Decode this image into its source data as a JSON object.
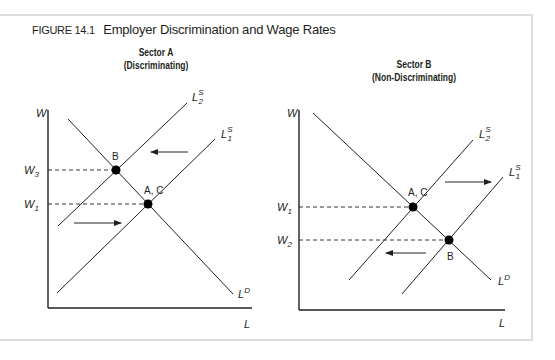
{
  "figure": {
    "number": "FIGURE 14.1",
    "title": "Employer Discrimination and Wage Rates"
  },
  "panels": [
    {
      "title": "Sector A",
      "subtitle": "(Discriminating)",
      "y_axis_label": "W",
      "x_axis_label": "L",
      "wage_labels": [
        {
          "main": "W",
          "sub": "3"
        },
        {
          "main": "W",
          "sub": "1"
        }
      ],
      "curves": {
        "supply_2": {
          "main": "L",
          "sup": "S",
          "sub": "2"
        },
        "supply_1": {
          "main": "L",
          "sup": "S",
          "sub": "1"
        },
        "demand": {
          "main": "L",
          "sup": "D"
        }
      },
      "points": [
        {
          "label": "B",
          "wage": "W3"
        },
        {
          "label": "A, C",
          "wage": "W1"
        }
      ],
      "arrows": [
        "left (upper: supply shifts left)",
        "right (lower: supply shifts right)"
      ]
    },
    {
      "title": "Sector B",
      "subtitle": "(Non-Discriminating)",
      "y_axis_label": "W",
      "x_axis_label": "L",
      "wage_labels": [
        {
          "main": "W",
          "sub": "1"
        },
        {
          "main": "W",
          "sub": "2"
        }
      ],
      "curves": {
        "supply_2": {
          "main": "L",
          "sup": "S",
          "sub": "2"
        },
        "supply_1": {
          "main": "L",
          "sup": "S",
          "sub": "1"
        },
        "demand": {
          "main": "L",
          "sup": "D"
        }
      },
      "points": [
        {
          "label": "A, C",
          "wage": "W1"
        },
        {
          "label": "B",
          "wage": "W2"
        }
      ],
      "arrows": [
        "right (upper: supply shifts right)",
        "left (lower: supply shifts left)"
      ]
    }
  ],
  "colors": {
    "ink": "#231f20",
    "frame": "#dcdcdc",
    "background": "#ffffff"
  }
}
